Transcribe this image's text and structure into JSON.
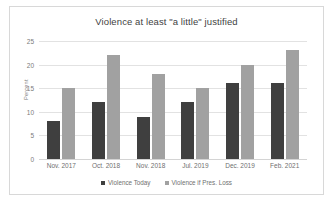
{
  "chart_data": {
    "type": "bar",
    "title": "Violence at least \"a little\" justified",
    "xlabel": "",
    "ylabel": "Percent",
    "ylim": [
      0,
      25
    ],
    "yticks": [
      "0",
      "5",
      "10",
      "15",
      "20",
      "25"
    ],
    "grid": true,
    "legend_position": "bottom-center",
    "categories": [
      "Nov. 2017",
      "Oct. 2018",
      "Nov. 2018",
      "Jul. 2019",
      "Dec. 2019",
      "Feb. 2021"
    ],
    "series": [
      {
        "name": "Violence Today",
        "color": "#3f3f3f",
        "values": [
          8,
          12,
          9,
          12,
          16,
          16
        ]
      },
      {
        "name": "Violence if Pres. Loss",
        "color": "#a1a1a1",
        "values": [
          15,
          22,
          18,
          15,
          20,
          23
        ]
      }
    ]
  }
}
